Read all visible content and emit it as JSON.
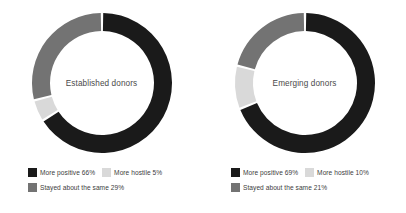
{
  "chart_data": {
    "type": "pie",
    "title": "",
    "subtitle": "",
    "variant": "donut",
    "legend_position": "bottom",
    "grid": false,
    "start_angle_deg": 0,
    "categories": [
      "More positive",
      "More hostile",
      "Stayed about the same"
    ],
    "colors": {
      "more_positive": "#1a1a1a",
      "more_hostile": "#d9d9d9",
      "stayed_about_the_same": "#737373",
      "background": "#ffffff",
      "text": "#3d3d3d"
    },
    "charts": [
      {
        "name": "Established donors",
        "center_label": "Established donors",
        "slices": [
          {
            "label": "More positive",
            "value": 66,
            "display": "66%",
            "color": "#1a1a1a"
          },
          {
            "label": "More hostile",
            "value": 5,
            "display": "5%",
            "color": "#d9d9d9"
          },
          {
            "label": "Stayed about the same",
            "value": 29,
            "display": "29%",
            "color": "#737373"
          }
        ]
      },
      {
        "name": "Emerging donors",
        "center_label": "Emerging donors",
        "slices": [
          {
            "label": "More positive",
            "value": 69,
            "display": "69%",
            "color": "#1a1a1a"
          },
          {
            "label": "More hostile",
            "value": 10,
            "display": "10%",
            "color": "#d9d9d9"
          },
          {
            "label": "Stayed about the same",
            "value": 21,
            "display": "21%",
            "color": "#737373"
          }
        ]
      }
    ]
  },
  "panels": [
    {
      "center_label": "Established donors",
      "legend": {
        "row1": [
          {
            "label": "More positive 66%",
            "color": "#1a1a1a"
          },
          {
            "label": "More hostile 5%",
            "color": "#d9d9d9"
          }
        ],
        "row2": [
          {
            "label": "Stayed about the same 29%",
            "color": "#737373"
          }
        ]
      }
    },
    {
      "center_label": "Emerging donors",
      "legend": {
        "row1": [
          {
            "label": "More positive 69%",
            "color": "#1a1a1a"
          },
          {
            "label": "More hostile 10%",
            "color": "#d9d9d9"
          }
        ],
        "row2": [
          {
            "label": "Stayed about the same 21%",
            "color": "#737373"
          }
        ]
      }
    }
  ]
}
